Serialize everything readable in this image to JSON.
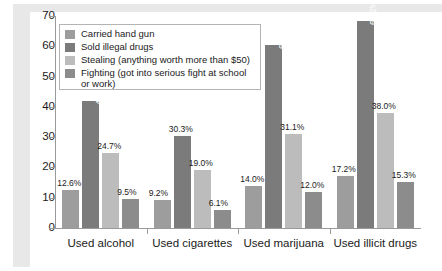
{
  "chart_data": {
    "type": "bar",
    "title": "",
    "subtitle": "",
    "xlabel": "",
    "ylabel": "",
    "ylim": [
      0,
      70
    ],
    "ytick_labels": [
      "70",
      "60",
      "50",
      "40",
      "30",
      "20",
      "10",
      "0"
    ],
    "ytick_values": [
      70,
      60,
      50,
      40,
      30,
      20,
      10,
      0
    ],
    "grid": false,
    "legend_position": "top-left-inside",
    "categories": [
      "Used alcohol",
      "Used cigarettes",
      "Used marijuana",
      "Used illicit drugs"
    ],
    "series": [
      {
        "name": "Carried hand gun",
        "color": "#9d9d9d",
        "values": [
          12.6,
          9.2,
          14.0,
          17.2
        ],
        "labels": [
          "12.6%",
          "9.2%",
          "14.0%",
          "17.2%"
        ]
      },
      {
        "name": "Sold illegal drugs",
        "color": "#7b7b7b",
        "values": [
          41.9,
          30.3,
          60.5,
          68.2
        ],
        "labels": [
          "41.9%",
          "30.3%",
          "60.5%",
          "68.2%"
        ]
      },
      {
        "name": "Stealing (anything worth more than $50)",
        "color": "#bcbcbc",
        "values": [
          24.7,
          19.0,
          31.1,
          38.0
        ],
        "labels": [
          "24.7%",
          "19.0%",
          "31.1%",
          "38.0%"
        ]
      },
      {
        "name": "Fighting (got into serious fight at school or work)",
        "color": "#8c8c8c",
        "values": [
          9.5,
          6.1,
          12.0,
          15.3
        ],
        "labels": [
          "9.5%",
          "6.1%",
          "12.0%",
          "15.3%"
        ]
      }
    ]
  },
  "legend": {
    "items": [
      {
        "label": "Carried hand gun",
        "color": "#9d9d9d"
      },
      {
        "label": "Sold illegal drugs",
        "color": "#7b7b7b"
      },
      {
        "label": "Stealing (anything worth more than $50)",
        "color": "#bcbcbc"
      },
      {
        "label": "Fighting (got into serious fight at school or work)",
        "color": "#8c8c8c"
      }
    ]
  }
}
